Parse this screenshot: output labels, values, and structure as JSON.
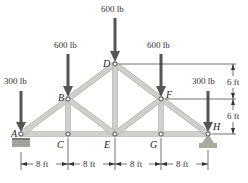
{
  "figure": {
    "type": "truss-diagram",
    "joints": [
      {
        "id": "A",
        "label": "A",
        "x": 21,
        "y": 134
      },
      {
        "id": "B",
        "label": "B",
        "x": 68,
        "y": 99
      },
      {
        "id": "C",
        "label": "C",
        "x": 68,
        "y": 134
      },
      {
        "id": "D",
        "label": "D",
        "x": 115,
        "y": 64
      },
      {
        "id": "E",
        "label": "E",
        "x": 115,
        "y": 134
      },
      {
        "id": "F",
        "label": "F",
        "x": 161,
        "y": 99
      },
      {
        "id": "G",
        "label": "G",
        "x": 161,
        "y": 134
      },
      {
        "id": "H",
        "label": "H",
        "x": 208,
        "y": 134
      }
    ],
    "members": [
      [
        "A",
        "B"
      ],
      [
        "B",
        "D"
      ],
      [
        "D",
        "F"
      ],
      [
        "F",
        "H"
      ],
      [
        "A",
        "C"
      ],
      [
        "C",
        "E"
      ],
      [
        "E",
        "G"
      ],
      [
        "G",
        "H"
      ],
      [
        "B",
        "C"
      ],
      [
        "B",
        "E"
      ],
      [
        "D",
        "E"
      ],
      [
        "F",
        "E"
      ],
      [
        "F",
        "G"
      ]
    ],
    "loads": [
      {
        "joint": "A",
        "label": "300 lb"
      },
      {
        "joint": "B",
        "label": "600 lb"
      },
      {
        "joint": "D",
        "label": "600 lb"
      },
      {
        "joint": "F",
        "label": "600 lb"
      },
      {
        "joint": "H",
        "label": "300 lb"
      }
    ],
    "supports": [
      {
        "joint": "A",
        "type": "roller"
      },
      {
        "joint": "H",
        "type": "pin"
      }
    ],
    "horizontal_dimensions": [
      "8 ft",
      "8 ft",
      "8 ft",
      "8 ft"
    ],
    "vertical_dimensions": [
      "6 ft",
      "6 ft"
    ]
  }
}
